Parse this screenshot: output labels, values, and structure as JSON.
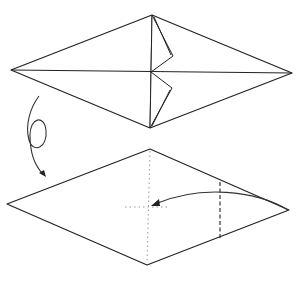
{
  "diagram": {
    "type": "origami-instructions",
    "steps": [
      {
        "name": "step-upper",
        "description": "Diamond-shaped base with two small flaps folded near the center, on the upper and lower halves of the vertical crease",
        "outline": [
          [
            11,
            70
          ],
          [
            152,
            15
          ],
          [
            292,
            73
          ],
          [
            150,
            128
          ]
        ],
        "creases": [
          {
            "from": [
              11,
              70
            ],
            "to": [
              292,
              73
            ]
          },
          {
            "from": [
              152,
              15
            ],
            "to": [
              150,
              128
            ]
          }
        ],
        "flaps": [
          {
            "points": [
              [
                152,
                15
              ],
              [
                173,
                56
              ],
              [
                151,
                72
              ]
            ]
          },
          {
            "points": [
              [
                151,
                72
              ],
              [
                172,
                88
              ],
              [
                150,
                128
              ]
            ]
          }
        ]
      },
      {
        "name": "turn-over-symbol",
        "meaning": "Turn the model over",
        "icon": "loop-arrow-icon"
      },
      {
        "name": "step-lower",
        "description": "Diamond base turned over; fold right point to center along valley fold",
        "outline": [
          [
            7,
            204
          ],
          [
            150,
            149
          ],
          [
            289,
            210
          ],
          [
            147,
            265
          ]
        ],
        "reference_lines": "dotted cross at center",
        "valley_fold": {
          "x": 220,
          "from_y": 182,
          "to_y": 238
        },
        "fold_arrow": {
          "from": [
            289,
            210
          ],
          "to": [
            150,
            205
          ],
          "icon": "curved-arrow-icon"
        }
      }
    ],
    "colors": {
      "line": "#222222",
      "reference": "#999999",
      "background": "#ffffff"
    }
  }
}
